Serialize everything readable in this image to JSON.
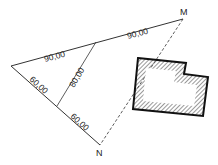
{
  "diagram": {
    "points": {
      "M": {
        "label": "M"
      },
      "N": {
        "label": "N"
      }
    },
    "dimensions": {
      "top_left_segment": "90,00",
      "top_right_segment": "90,00",
      "middle_line": "80,00",
      "bottom_upper_segment": "60,00",
      "bottom_lower_segment": "60,00"
    },
    "building": {
      "fill": "hatched",
      "outline_color": "#111111"
    },
    "colors": {
      "line": "#333333",
      "hatch": "#555555"
    }
  }
}
